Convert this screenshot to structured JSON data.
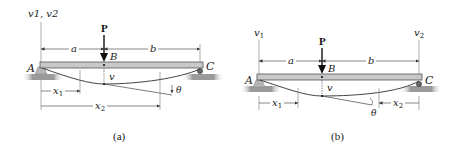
{
  "figures": [
    {
      "id": "a",
      "caption": "(a)",
      "axis_label_left": "v1, v2",
      "load_label": "P",
      "point_labels": {
        "left_support": "A",
        "load_point": "B",
        "right_support": "C"
      },
      "span_labels": {
        "left": "a",
        "right": "b"
      },
      "deflection_label": "v",
      "slope_label": "θ",
      "coordinates": [
        {
          "name": "x1",
          "origin": "A",
          "direction": "right"
        },
        {
          "name": "x2",
          "origin": "A",
          "direction": "right"
        }
      ]
    },
    {
      "id": "b",
      "caption": "(b)",
      "axis_label_left": "v1",
      "axis_label_right": "v2",
      "load_label": "P",
      "point_labels": {
        "left_support": "A",
        "load_point": "B",
        "right_support": "C"
      },
      "span_labels": {
        "left": "a",
        "right": "b"
      },
      "deflection_label": "v",
      "slope_label": "θ",
      "coordinates": [
        {
          "name": "x1",
          "origin": "A",
          "direction": "right"
        },
        {
          "name": "x2",
          "origin": "C",
          "direction": "left"
        }
      ]
    }
  ],
  "colors": {
    "beam": "#c8c8c8",
    "beam_edge": "#555555",
    "ground": "#9a9a9a",
    "line": "#333333"
  }
}
